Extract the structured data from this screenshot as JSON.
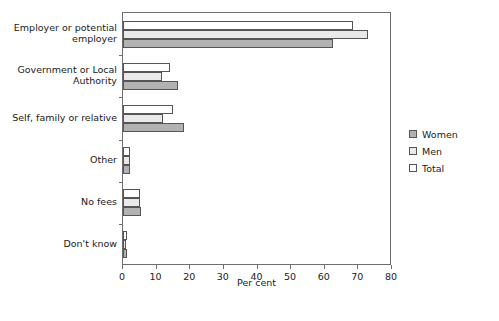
{
  "chart_data": {
    "type": "bar",
    "orientation": "horizontal",
    "title": "",
    "xlabel": "Per cent",
    "ylabel": "",
    "xlim": [
      0,
      80
    ],
    "xticks": [
      0,
      10,
      20,
      30,
      40,
      50,
      60,
      70,
      80
    ],
    "grid": false,
    "legend_position": "right",
    "categories": [
      "Employer or potential\nemployer",
      "Government or Local\nAuthority",
      "Self, family or relative",
      "Other",
      "No fees",
      "Don't know"
    ],
    "series": [
      {
        "name": "Total",
        "color": "#ffffff",
        "values": [
          68.5,
          14.0,
          14.8,
          2.0,
          5.0,
          1.2
        ]
      },
      {
        "name": "Men",
        "color": "#e9e9e9",
        "values": [
          73.0,
          11.5,
          12.0,
          2.0,
          5.0,
          1.0
        ]
      },
      {
        "name": "Women",
        "color": "#b2b2b2",
        "values": [
          62.5,
          16.5,
          18.0,
          2.0,
          5.4,
          1.2
        ]
      }
    ],
    "series_draw_order": [
      "Total",
      "Men",
      "Women"
    ],
    "legend": [
      {
        "label": "Women",
        "swatch": "women"
      },
      {
        "label": "Men",
        "swatch": "men"
      },
      {
        "label": "Total",
        "swatch": "total"
      }
    ]
  }
}
